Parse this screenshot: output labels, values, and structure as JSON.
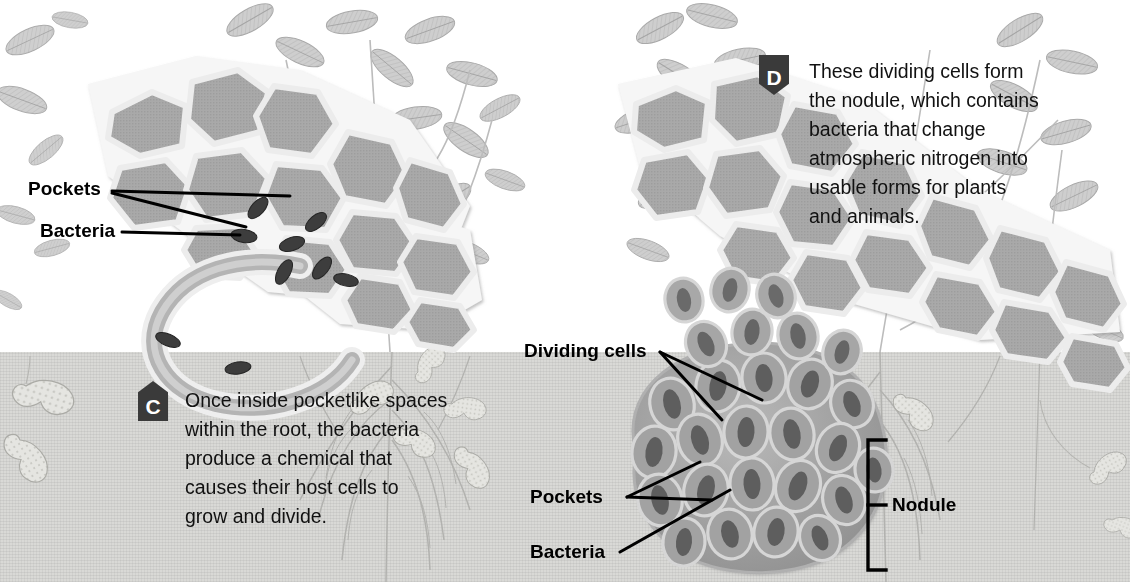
{
  "figure": {
    "soil_line_y": 355
  },
  "steps": [
    {
      "id": "C",
      "badge_letter": "C",
      "badge_shape": "pentagon-up",
      "text": "Once inside pocketlike spaces\nwithin the root, the bacteria\nproduce a chemical that\ncauses their host cells to\ngrow and divide."
    },
    {
      "id": "D",
      "badge_letter": "D",
      "badge_shape": "shield-down",
      "text": "These dividing cells form\nthe nodule, which contains\nbacteria that change\natmospheric nitrogen into\nusable forms for plants\nand animals."
    }
  ],
  "labels": {
    "left_pockets": "Pockets",
    "left_bacteria": "Bacteria",
    "right_dividing_cells": "Dividing cells",
    "right_pockets": "Pockets",
    "right_bacteria": "Bacteria",
    "nodule": "Nodule"
  },
  "colors": {
    "soil": "#d9d9d6",
    "sky": "#ffffff",
    "cell_fill": "#a9a9a9",
    "cell_wall": "#f4f4f4",
    "bacteria": "#3d3d3d",
    "foliage": "#c9c9c9",
    "leader_line": "#000000",
    "badge": "#3a3a3a",
    "text": "#111111"
  },
  "scene": {
    "left_panel_caption": "Infection thread entering root cells with bacteria in pockets",
    "right_panel_caption": "Mature nodule of dividing cells packed with bacteroids",
    "background_plant": "peanut (legume) foliage and root system with pods"
  }
}
